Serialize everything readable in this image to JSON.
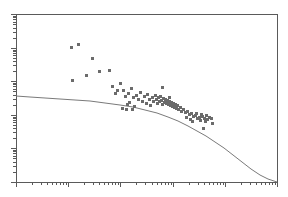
{
  "chart_data": {
    "type": "scatter",
    "title": "",
    "subtitle": "",
    "xlabel": "",
    "ylabel": "",
    "xscale": "log",
    "yscale": "log",
    "grid": false,
    "legend": null,
    "xlim": [
      1,
      100000
    ],
    "ylim": [
      0.001,
      100
    ],
    "axis_decades_x": 5,
    "axis_decades_y": 5,
    "marker": {
      "shape": "square",
      "size_px": 3,
      "color": "#6b6b6b"
    },
    "fit_line": {
      "name": "fitted curve",
      "color": "#7a7a7a",
      "width_px": 1,
      "points_px": [
        [
          16,
          96
        ],
        [
          30,
          97
        ],
        [
          45,
          98
        ],
        [
          60,
          99
        ],
        [
          75,
          100
        ],
        [
          90,
          101
        ],
        [
          105,
          103
        ],
        [
          120,
          105
        ],
        [
          133,
          107
        ],
        [
          145,
          110
        ],
        [
          157,
          113
        ],
        [
          168,
          117
        ],
        [
          178,
          121
        ],
        [
          188,
          126
        ],
        [
          197,
          131
        ],
        [
          206,
          136
        ],
        [
          215,
          142
        ],
        [
          224,
          148
        ],
        [
          233,
          155
        ],
        [
          242,
          162
        ],
        [
          251,
          169
        ],
        [
          260,
          175
        ],
        [
          268,
          179
        ],
        [
          274,
          181
        ],
        [
          277,
          182
        ]
      ]
    },
    "series": [
      {
        "name": "observations",
        "points_px": [
          [
            71,
            47
          ],
          [
            78,
            44
          ],
          [
            92,
            58
          ],
          [
            72,
            80
          ],
          [
            86,
            75
          ],
          [
            99,
            71
          ],
          [
            109,
            70
          ],
          [
            112,
            86
          ],
          [
            120,
            83
          ],
          [
            123,
            90
          ],
          [
            125,
            96
          ],
          [
            128,
            93
          ],
          [
            131,
            88
          ],
          [
            127,
            104
          ],
          [
            129,
            102
          ],
          [
            133,
            97
          ],
          [
            136,
            95
          ],
          [
            138,
            99
          ],
          [
            140,
            92
          ],
          [
            142,
            101
          ],
          [
            144,
            96
          ],
          [
            146,
            103
          ],
          [
            147,
            94
          ],
          [
            149,
            99
          ],
          [
            150,
            105
          ],
          [
            152,
            97
          ],
          [
            153,
            101
          ],
          [
            155,
            95
          ],
          [
            156,
            99
          ],
          [
            157,
            103
          ],
          [
            158,
            97
          ],
          [
            159,
            101
          ],
          [
            160,
            96
          ],
          [
            161,
            100
          ],
          [
            162,
            104
          ],
          [
            163,
            98
          ],
          [
            164,
            102
          ],
          [
            165,
            99
          ],
          [
            166,
            103
          ],
          [
            167,
            100
          ],
          [
            168,
            104
          ],
          [
            169,
            101
          ],
          [
            170,
            105
          ],
          [
            171,
            102
          ],
          [
            172,
            106
          ],
          [
            173,
            103
          ],
          [
            174,
            107
          ],
          [
            175,
            104
          ],
          [
            176,
            108
          ],
          [
            177,
            105
          ],
          [
            178,
            109
          ],
          [
            180,
            107
          ],
          [
            181,
            111
          ],
          [
            183,
            109
          ],
          [
            185,
            112
          ],
          [
            187,
            111
          ],
          [
            189,
            114
          ],
          [
            191,
            113
          ],
          [
            193,
            116
          ],
          [
            162,
            87
          ],
          [
            169,
            97
          ],
          [
            186,
            117
          ],
          [
            190,
            119
          ],
          [
            192,
            121
          ],
          [
            195,
            115
          ],
          [
            197,
            118
          ],
          [
            199,
            117
          ],
          [
            200,
            120
          ],
          [
            202,
            116
          ],
          [
            204,
            118
          ],
          [
            206,
            115
          ],
          [
            207,
            119
          ],
          [
            209,
            117
          ],
          [
            196,
            113
          ],
          [
            201,
            114
          ],
          [
            211,
            118
          ],
          [
            205,
            121
          ],
          [
            132,
            109
          ],
          [
            134,
            106
          ],
          [
            126,
            109
          ],
          [
            122,
            108
          ],
          [
            117,
            90
          ],
          [
            115,
            93
          ],
          [
            212,
            123
          ],
          [
            203,
            128
          ]
        ]
      }
    ],
    "annotations": []
  },
  "axes": {
    "frame": {
      "left": 16,
      "top": 14,
      "right": 277,
      "bottom": 182,
      "color": "#5a5a5a"
    },
    "x_major_px": [
      16,
      68,
      120,
      173,
      225,
      277
    ],
    "y_major_px": [
      182,
      148,
      115,
      81,
      48,
      14
    ],
    "tick_color": "#5a5a5a"
  }
}
